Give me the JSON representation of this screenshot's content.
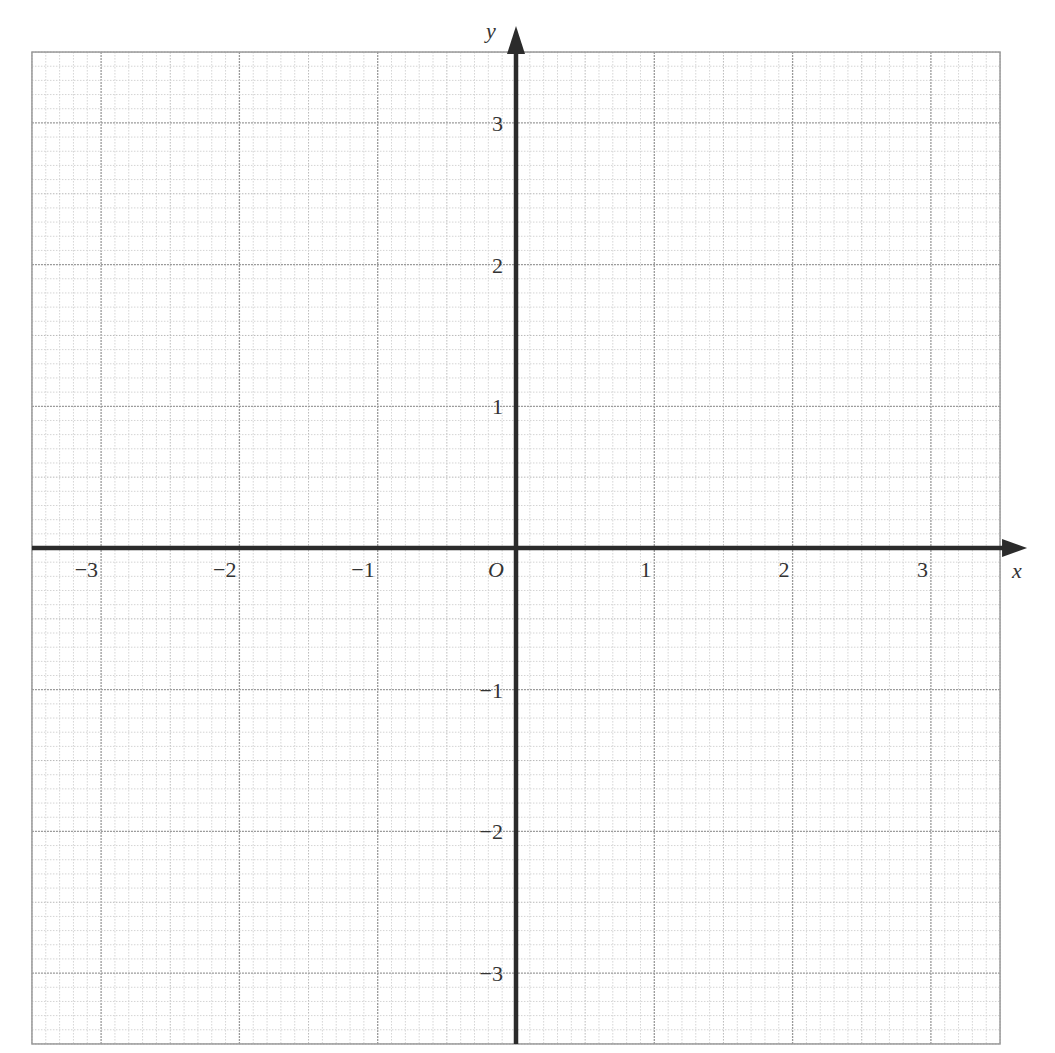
{
  "chart_data": {
    "type": "scatter",
    "title": "",
    "xlabel": "x",
    "ylabel": "y",
    "origin_label": "O",
    "xlim": [
      -3.5,
      3.5
    ],
    "ylim": [
      -3.5,
      3.5
    ],
    "grid": true,
    "grid_minor_step": 0.1,
    "grid_medium_step": 0.5,
    "grid_major_step": 1,
    "x_ticks": [
      -3,
      -2,
      -1,
      1,
      2,
      3
    ],
    "x_tick_labels": [
      "−3",
      "−2",
      "−1",
      "1",
      "2",
      "3"
    ],
    "y_ticks": [
      3,
      2,
      1,
      -1,
      -2,
      -3
    ],
    "y_tick_labels": [
      "3",
      "2",
      "1",
      "−1",
      "−2",
      "−3"
    ],
    "series": [],
    "legend": null
  },
  "colors": {
    "axis": "#2b2b2b",
    "grid_minor": "#d4d4d4",
    "grid_medium": "#b8b8b8",
    "grid_major": "#9a9a9a",
    "label": "#333333"
  }
}
